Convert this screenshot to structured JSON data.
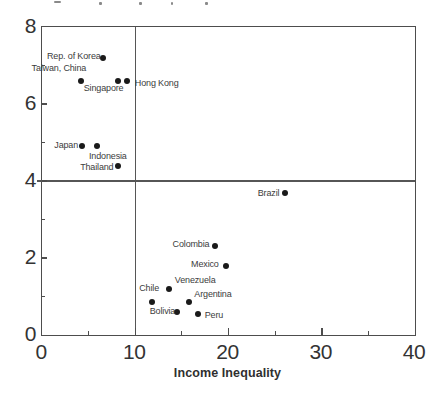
{
  "chart_data": {
    "type": "scatter",
    "xlabel": "Income Inequality",
    "ylabel": "",
    "xlim": [
      0,
      40
    ],
    "ylim": [
      0,
      8
    ],
    "grid": false,
    "legend": false,
    "x_ticks": {
      "major": [
        0,
        10,
        20,
        30,
        40
      ],
      "minor": [
        5,
        15,
        25,
        35
      ],
      "labels": [
        "0",
        "10",
        "20",
        "30",
        "40"
      ]
    },
    "y_ticks": {
      "major": [
        0,
        2,
        4,
        6,
        8
      ],
      "minor": [
        1,
        3,
        5,
        7
      ],
      "labels": [
        "0",
        "2",
        "4",
        "6",
        "8"
      ]
    },
    "reference_lines": [
      {
        "orientation": "vertical",
        "x": 10
      },
      {
        "orientation": "horizontal",
        "y": 4
      }
    ],
    "marker": {
      "shape": "circle",
      "color": "#1a1a1a",
      "diameter_px": 6
    },
    "points": [
      {
        "label": "Rep. of Korea",
        "x": 6.5,
        "y": 7.2,
        "label_pos": {
          "ha": "right",
          "dx": -2,
          "dy": -2
        }
      },
      {
        "label": "Taiwan, China",
        "x": 4.2,
        "y": 6.6,
        "label_pos": {
          "ha": "right",
          "dx": 5,
          "dy": -13
        }
      },
      {
        "label": "Singapore",
        "x": 8.2,
        "y": 6.6,
        "label_pos": {
          "ha": "right",
          "dx": 5,
          "dy": 7
        }
      },
      {
        "label": "Hong Kong",
        "x": 9.1,
        "y": 6.6,
        "label_pos": {
          "ha": "left",
          "dx": 8,
          "dy": 2
        }
      },
      {
        "label": "Japan",
        "x": 4.3,
        "y": 4.9,
        "label_pos": {
          "ha": "right",
          "dx": -4,
          "dy": -1
        }
      },
      {
        "label": "Indonesia",
        "x": 5.9,
        "y": 4.9,
        "label_pos": {
          "ha": "left",
          "dx": -8,
          "dy": 10
        }
      },
      {
        "label": "Thailand",
        "x": 8.2,
        "y": 4.4,
        "label_pos": {
          "ha": "right",
          "dx": -5,
          "dy": 1
        }
      },
      {
        "label": "Brazil",
        "x": 26.1,
        "y": 3.7,
        "label_pos": {
          "ha": "right",
          "dx": -6,
          "dy": 0
        }
      },
      {
        "label": "Colombia",
        "x": 18.6,
        "y": 2.3,
        "label_pos": {
          "ha": "right",
          "dx": -6,
          "dy": -2
        }
      },
      {
        "label": "Mexico",
        "x": 19.7,
        "y": 1.8,
        "label_pos": {
          "ha": "right",
          "dx": -7,
          "dy": -2
        }
      },
      {
        "label": "Venezuela",
        "x": 13.6,
        "y": 1.2,
        "label_pos": {
          "ha": "left",
          "dx": 6,
          "dy": -9
        }
      },
      {
        "label": "Chile",
        "x": 11.8,
        "y": 0.85,
        "label_pos": {
          "ha": "right",
          "dx": 7,
          "dy": -14
        }
      },
      {
        "label": "Argentina",
        "x": 15.8,
        "y": 0.85,
        "label_pos": {
          "ha": "left",
          "dx": 5,
          "dy": -8
        }
      },
      {
        "label": "Bolivia",
        "x": 14.5,
        "y": 0.6,
        "label_pos": {
          "ha": "right",
          "dx": -2,
          "dy": -1
        }
      },
      {
        "label": "Peru",
        "x": 16.7,
        "y": 0.55,
        "label_pos": {
          "ha": "left",
          "dx": 7,
          "dy": 1
        }
      }
    ]
  },
  "colors": {
    "background": "#ffffff",
    "axis": "#4d4d4d",
    "marker": "#1a1a1a",
    "label_text": "#3c3c3c"
  }
}
